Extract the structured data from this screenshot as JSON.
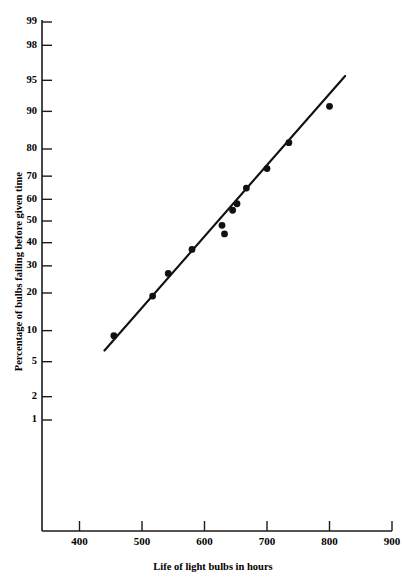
{
  "chart_data": {
    "type": "scatter",
    "title": "",
    "xlabel": "Life of light bulbs in hours",
    "ylabel": "Percentage of bulbs failing before given time",
    "plot_kind": "normal-probability-plot",
    "xlim": [
      340,
      900
    ],
    "xticks": [
      400,
      500,
      600,
      700,
      800,
      900
    ],
    "yticks": [
      1,
      2,
      5,
      10,
      20,
      30,
      40,
      50,
      60,
      70,
      80,
      90,
      95,
      98,
      99
    ],
    "ytick_labels": [
      "1",
      "2",
      "5",
      "10",
      "20",
      "30",
      "40",
      "50",
      "60",
      "70",
      "80",
      "90",
      "95",
      "98",
      "99"
    ],
    "ylim_percent": [
      1,
      99
    ],
    "grid": false,
    "legend": false,
    "marker_color": "#111111",
    "line_color": "#111111",
    "axis_color": "#1a1a1a",
    "points": [
      {
        "x": 455,
        "y": 9
      },
      {
        "x": 517,
        "y": 19
      },
      {
        "x": 542,
        "y": 27
      },
      {
        "x": 580,
        "y": 37
      },
      {
        "x": 628,
        "y": 48
      },
      {
        "x": 632,
        "y": 44
      },
      {
        "x": 645,
        "y": 55
      },
      {
        "x": 652,
        "y": 58
      },
      {
        "x": 667,
        "y": 65
      },
      {
        "x": 700,
        "y": 73
      },
      {
        "x": 735,
        "y": 82
      },
      {
        "x": 800,
        "y": 91
      }
    ],
    "fit_line": {
      "x_start": 440,
      "y_start": 6.5,
      "x_end": 825,
      "y_end": 95.5
    }
  }
}
